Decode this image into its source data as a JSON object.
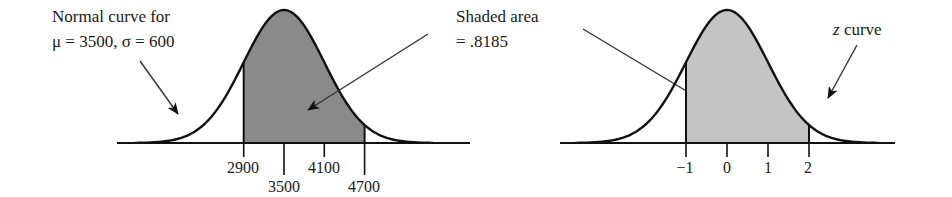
{
  "figure": {
    "left_panel": {
      "annotation_line1": "Normal curve for",
      "annotation_line2": "μ = 3500, σ = 600",
      "mean": 3500,
      "sd": 600,
      "shaded_from": 2900,
      "shaded_to": 4700,
      "shade_color": "#8a8a8a",
      "ticks": [
        {
          "label": "2900",
          "row": 1
        },
        {
          "label": "3500",
          "row": 2
        },
        {
          "label": "4100",
          "row": 1
        },
        {
          "label": "4700",
          "row": 2
        }
      ]
    },
    "middle_annotation": {
      "line1": "Shaded area",
      "line2": "= .8185"
    },
    "right_panel": {
      "annotation_italic": "z",
      "annotation_rest": " curve",
      "shaded_from": -1,
      "shaded_to": 2,
      "shade_color": "#c4c4c4",
      "ticks": [
        {
          "label": "−1"
        },
        {
          "label": "0"
        },
        {
          "label": "1"
        },
        {
          "label": "2"
        }
      ]
    }
  },
  "chart_data": [
    {
      "type": "area",
      "title": "Normal curve for μ = 3500, σ = 600",
      "distribution": "normal",
      "mean": 3500,
      "sd": 600,
      "x_ticks": [
        2900,
        3500,
        4100,
        4700
      ],
      "shaded_interval": [
        2900,
        4700
      ],
      "shaded_area": 0.8185,
      "xlabel": "",
      "ylabel": "",
      "grid": false
    },
    {
      "type": "area",
      "title": "z curve",
      "distribution": "standard normal",
      "mean": 0,
      "sd": 1,
      "x_ticks": [
        -1,
        0,
        1,
        2
      ],
      "shaded_interval": [
        -1,
        2
      ],
      "shaded_area": 0.8185,
      "annotation": "Shaded area = .8185",
      "xlabel": "",
      "ylabel": "",
      "grid": false
    }
  ]
}
